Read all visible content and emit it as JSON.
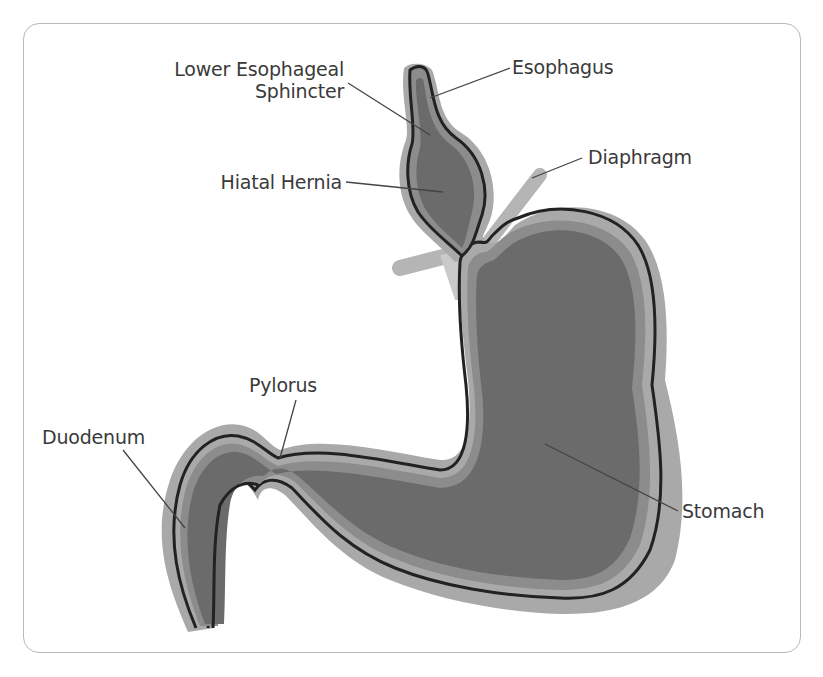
{
  "diagram": {
    "colors": {
      "outer_layer": "#a9a9a9",
      "wall_line": "#222222",
      "mucosa": "#8c8c8c",
      "lumen": "#6b6b6b",
      "diaphragm": "#b3b3b3",
      "label_text": "#3a3a3a",
      "leader_line": "#444444",
      "frame_border": "#b9b9b9"
    },
    "labels": {
      "les_line1": "Lower Esophageal",
      "les_line2": "Sphincter",
      "esophagus": "Esophagus",
      "diaphragm": "Diaphragm",
      "hiatal_hernia": "Hiatal Hernia",
      "pylorus": "Pylorus",
      "duodenum": "Duodenum",
      "stomach": "Stomach"
    }
  }
}
